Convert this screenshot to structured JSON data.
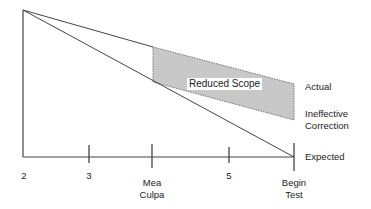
{
  "diagram": {
    "colors": {
      "line": "#444444",
      "region_fill": "#c8c8c8",
      "region_border": "#666666",
      "text": "#222222"
    },
    "region": {
      "label": "Reduced Scope"
    },
    "right_labels": {
      "actual": "Actual",
      "ineffective_line1": "Ineffective",
      "ineffective_line2": "Correction",
      "expected": "Expected"
    },
    "axis_ticks": [
      {
        "label_line1": "2",
        "label_line2": ""
      },
      {
        "label_line1": "3",
        "label_line2": ""
      },
      {
        "label_line1": "Mea",
        "label_line2": "Culpa"
      },
      {
        "label_line1": "5",
        "label_line2": ""
      },
      {
        "label_line1": "Begin",
        "label_line2": "Test"
      }
    ]
  }
}
